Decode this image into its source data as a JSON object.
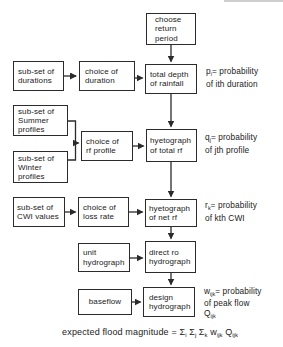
{
  "colors": {
    "ink": "#2b2b2b",
    "paper": "#ffffff",
    "artifact_gray": "#cfcfcf"
  },
  "flowchart": {
    "boxes": {
      "choose_return_period": {
        "lines": [
          "choose",
          "return",
          "period"
        ]
      },
      "subset_durations": {
        "lines": [
          "sub-set of",
          "durations"
        ]
      },
      "choice_duration": {
        "lines": [
          "choice of",
          "duration"
        ]
      },
      "total_depth_rainfall": {
        "lines": [
          "total depth",
          "of rainfall"
        ]
      },
      "subset_summer_profiles": {
        "lines": [
          "sub-set of",
          "Summer",
          "profiles"
        ]
      },
      "subset_winter_profiles": {
        "lines": [
          "sub-set of",
          "Winter",
          "profiles"
        ]
      },
      "choice_rf_profile": {
        "lines": [
          "choice of",
          "rf profile"
        ]
      },
      "hyetograph_total_rf": {
        "lines": [
          "hyetograph",
          "of total rf"
        ]
      },
      "subset_cwi_values": {
        "lines": [
          "sub-set of",
          "CWI values"
        ]
      },
      "choice_loss_rate": {
        "lines": [
          "choice of",
          "loss rate"
        ]
      },
      "hyetograph_net_rf": {
        "lines": [
          "hyetograph",
          "of net rf"
        ]
      },
      "unit_hydrograph": {
        "lines": [
          "unit",
          "hydrograph"
        ]
      },
      "direct_ro_hydrograph": {
        "lines": [
          "direct ro",
          "hydrograph"
        ]
      },
      "baseflow": {
        "lines": [
          "baseflow"
        ]
      },
      "design_hydrograph": {
        "lines": [
          "design",
          "hydrograph"
        ]
      }
    },
    "annotations": {
      "p": {
        "line1_segments": [
          {
            "t": "p"
          },
          {
            "t": "i",
            "sub": true
          },
          {
            "t": "= probability"
          }
        ],
        "line2": "of ith duration"
      },
      "q": {
        "line1_segments": [
          {
            "t": "q"
          },
          {
            "t": "j",
            "sub": true
          },
          {
            "t": "= probability"
          }
        ],
        "line2": "of jth profile"
      },
      "r": {
        "line1_segments": [
          {
            "t": "r"
          },
          {
            "t": "k",
            "sub": true
          },
          {
            "t": "= probability"
          }
        ],
        "line2": "of kth CWI"
      },
      "w": {
        "line1_segments": [
          {
            "t": "w"
          },
          {
            "t": "ijk",
            "sub": true
          },
          {
            "t": "= probability"
          }
        ],
        "line2": "of peak flow",
        "line3_segments": [
          {
            "t": "Q"
          },
          {
            "t": "ijk",
            "sub": true
          }
        ]
      }
    },
    "caption_segments": [
      {
        "t": "expected flood magnitude = "
      },
      {
        "t": "Σ"
      },
      {
        "t": "i",
        "sub": true
      },
      {
        "t": " Σ"
      },
      {
        "t": "j",
        "sub": true
      },
      {
        "t": " Σ"
      },
      {
        "t": "k",
        "sub": true
      },
      {
        "t": " w"
      },
      {
        "t": "ijk",
        "sub": true
      },
      {
        "t": " Q"
      },
      {
        "t": "ijk",
        "sub": true
      }
    ]
  }
}
